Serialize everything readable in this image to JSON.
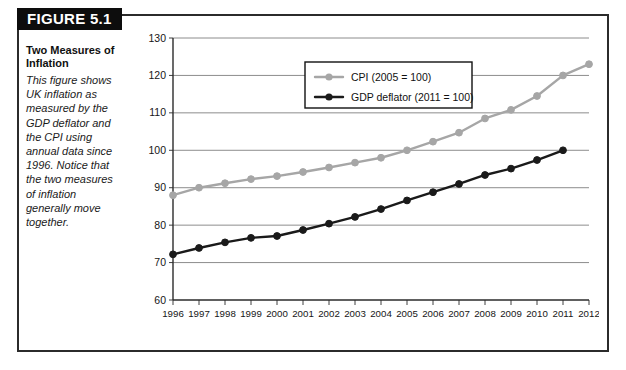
{
  "figure": {
    "banner_label": "FIGURE 5.1",
    "caption_title": "Two Measures of Inflation",
    "caption_body": "This figure shows UK inflation as measured by the GDP deflator and the CPI using annual data since 1996. Notice that the two measures of inflation generally move together."
  },
  "colors": {
    "cpi": "#a6a6a6",
    "deflator": "#1a1a1a",
    "grid": "#808080",
    "axis": "#2b2b2b",
    "frame": "#2b2b2b",
    "banner_bg": "#0d0d0d",
    "banner_text": "#ffffff"
  },
  "chart_data": {
    "type": "line",
    "title": "",
    "xlabel": "",
    "ylabel": "",
    "grid": true,
    "legend_position": "top-center",
    "xlim": [
      1996,
      2012
    ],
    "ylim": [
      60,
      130
    ],
    "yticks": [
      60,
      70,
      80,
      90,
      100,
      110,
      120,
      130
    ],
    "categories": [
      1996,
      1997,
      1998,
      1999,
      2000,
      2001,
      2002,
      2003,
      2004,
      2005,
      2006,
      2007,
      2008,
      2009,
      2010,
      2011,
      2012
    ],
    "xticklabels": [
      "1996",
      "1997",
      "1998",
      "1999",
      "2000",
      "2001",
      "2002",
      "2003",
      "2004",
      "2005",
      "2006",
      "2007",
      "2008",
      "2009",
      "2010",
      "2011",
      "2012"
    ],
    "yticklabels": [
      "60",
      "70",
      "80",
      "90",
      "100",
      "110",
      "120",
      "130"
    ],
    "series": [
      {
        "name": "CPI (2005 = 100)",
        "color": "#a6a6a6",
        "marker": "circle",
        "x": [
          1996,
          1997,
          1998,
          1999,
          2000,
          2001,
          2002,
          2003,
          2004,
          2005,
          2006,
          2007,
          2008,
          2009,
          2010,
          2011,
          2012
        ],
        "values": [
          88.0,
          90.0,
          91.2,
          92.3,
          93.1,
          94.2,
          95.4,
          96.7,
          98.0,
          100.0,
          102.3,
          104.7,
          108.5,
          110.8,
          114.5,
          120.0,
          123.0
        ]
      },
      {
        "name": "GDP deflator (2011 = 100)",
        "color": "#1a1a1a",
        "marker": "circle",
        "x": [
          1996,
          1997,
          1998,
          1999,
          2000,
          2001,
          2002,
          2003,
          2004,
          2005,
          2006,
          2007,
          2008,
          2009,
          2010,
          2011
        ],
        "values": [
          72.2,
          73.9,
          75.4,
          76.6,
          77.1,
          78.7,
          80.4,
          82.2,
          84.3,
          86.6,
          88.8,
          91.0,
          93.4,
          95.1,
          97.4,
          100.0
        ]
      }
    ],
    "legend": [
      {
        "label": "CPI (2005 = 100)",
        "color": "#a6a6a6"
      },
      {
        "label": "GDP deflator (2011 = 100)",
        "color": "#1a1a1a"
      }
    ]
  }
}
